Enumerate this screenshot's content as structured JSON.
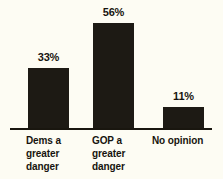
{
  "chart_data": {
    "type": "bar",
    "title": "",
    "subtitle": "",
    "xlabel": "",
    "ylabel": "",
    "ylim": [
      0,
      60
    ],
    "grid": false,
    "legend": null,
    "categories": [
      "Dems a\ngreater\ndanger",
      "GOP a\ngreater\ndanger",
      "No opinion"
    ],
    "values": [
      33,
      56,
      11
    ],
    "data_labels": [
      "33%",
      "56%",
      "11%"
    ],
    "colors": {
      "background": "#fdfcf3",
      "bar": "#1d1a14",
      "axis": "#19160f",
      "text": "#17140e"
    }
  }
}
